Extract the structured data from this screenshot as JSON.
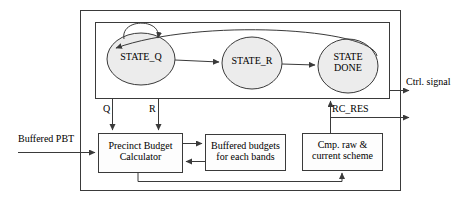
{
  "diagram": {
    "type": "block-diagram-with-fsm",
    "colors": {
      "stroke": "#3a3a3a",
      "state_fill": "#ececec",
      "box_fill": "#fdfdfd",
      "background": "#ffffff",
      "text": "#000000"
    }
  },
  "outer_box": {
    "name": "system-boundary"
  },
  "fsm_box": {
    "name": "fsm-boundary"
  },
  "states": [
    {
      "id": "state-q",
      "label": "STATE_Q",
      "lines": [
        "STATE_Q"
      ]
    },
    {
      "id": "state-r",
      "label": "STATE_R",
      "lines": [
        "STATE_R"
      ]
    },
    {
      "id": "state-done",
      "label": "STATE DONE",
      "lines": [
        "STATE",
        "DONE"
      ]
    }
  ],
  "blocks": [
    {
      "id": "precinct-budget-calculator",
      "label": "Precinct Budget Calculator",
      "lines": [
        "Precinct Budget",
        "Calculator"
      ]
    },
    {
      "id": "buffered-budgets",
      "label": "Buffered budgets for each bands",
      "lines": [
        "Buffered budgets",
        "for each bands"
      ]
    },
    {
      "id": "cmp-raw-current-scheme",
      "label": "Cmp. raw & current scheme",
      "lines": [
        "Cmp. raw &",
        "current scheme"
      ]
    }
  ],
  "signals": {
    "q": "Q",
    "r": "R",
    "rc_res": "RC_RES",
    "buffered_pbt": "Buffered PBT",
    "ctrl_signal": "Ctrl. signal"
  },
  "transitions": [
    {
      "from": "state-q",
      "to": "state-q",
      "kind": "self-loop"
    },
    {
      "from": "state-q",
      "to": "state-r",
      "kind": "straight"
    },
    {
      "from": "state-r",
      "to": "state-done",
      "kind": "straight"
    },
    {
      "from": "state-done",
      "to": "state-q",
      "kind": "curved-feedback"
    }
  ]
}
